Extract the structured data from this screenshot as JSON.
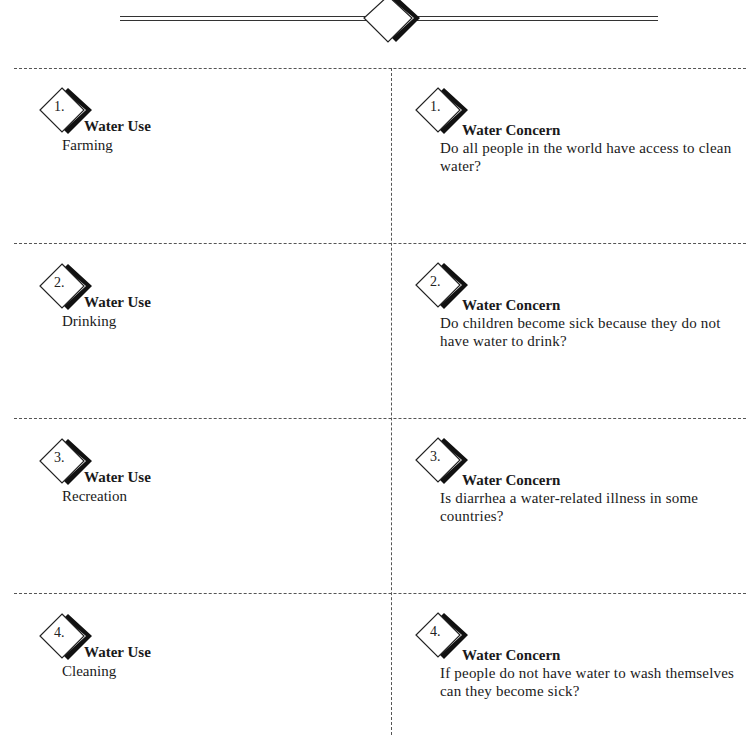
{
  "header": {
    "ornament": "diamond-rule-ornament"
  },
  "columns": {
    "left_heading": "Water Use",
    "right_heading": "Water Concern"
  },
  "rows": [
    {
      "number": "1.",
      "use": {
        "title": "Water Use",
        "text": "Farming"
      },
      "concern": {
        "title": "Water Concern",
        "text": "Do all people in the world have access to clean water?"
      }
    },
    {
      "number": "2.",
      "use": {
        "title": "Water Use",
        "text": "Drinking"
      },
      "concern": {
        "title": "Water Concern",
        "text": "Do children become sick because they do not have water to drink?"
      }
    },
    {
      "number": "3.",
      "use": {
        "title": "Water Use",
        "text": "Recreation"
      },
      "concern": {
        "title": "Water Concern",
        "text": "Is diarrhea a water-related illness in some countries?"
      }
    },
    {
      "number": "4.",
      "use": {
        "title": "Water Use",
        "text": "Cleaning"
      },
      "concern": {
        "title": "Water Concern",
        "text": "If people do not have water to wash themselves can they become sick?"
      }
    }
  ],
  "colors": {
    "ink": "#1a1a1a",
    "cut_line": "#555555",
    "background": "#ffffff"
  }
}
